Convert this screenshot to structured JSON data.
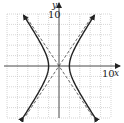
{
  "chart_data": {
    "type": "line",
    "title": "",
    "xlabel": "x",
    "ylabel": "y",
    "xlim": [
      -10,
      10
    ],
    "ylim": [
      -10,
      10
    ],
    "grid": true,
    "grid_step": 2,
    "tick_labels": {
      "x_max": "10",
      "y_max": "10"
    },
    "series": [
      {
        "name": "hyperbola x^2/4 - y^2/9 = 1",
        "style": "solid",
        "a": 2,
        "b": 3,
        "vertices": [
          [
            -2,
            0
          ],
          [
            2,
            0
          ]
        ]
      },
      {
        "name": "asymptote y = 1.5x",
        "style": "dashed",
        "slope": 1.5
      },
      {
        "name": "asymptote y = -1.5x",
        "style": "dashed",
        "slope": -1.5
      }
    ]
  },
  "labels": {
    "y_axis": "y",
    "x_axis": "x",
    "y_tick": "10",
    "x_tick": "10"
  },
  "colors": {
    "grid": "#bbbbbb",
    "axis": "#333333",
    "curve": "#222222"
  }
}
